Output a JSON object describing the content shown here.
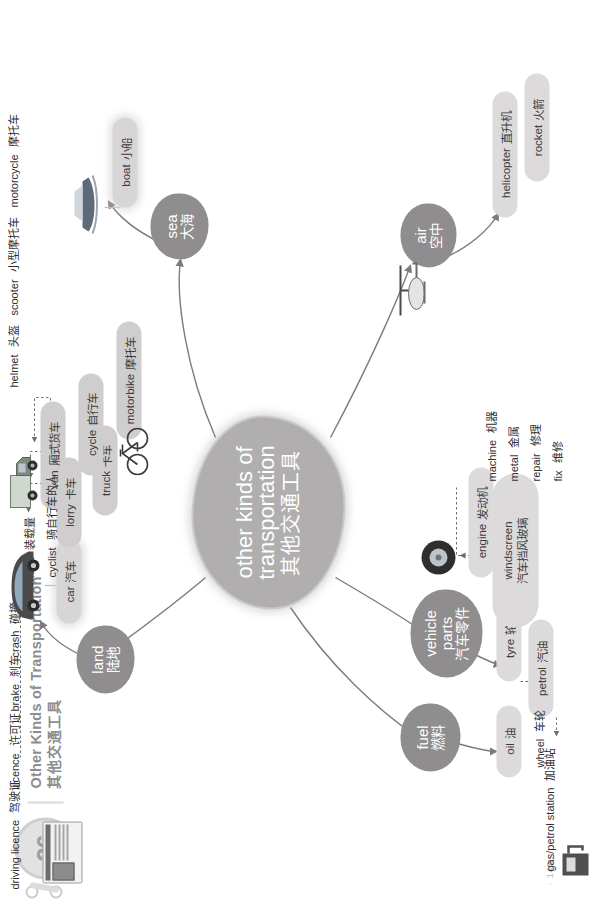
{
  "header": {
    "badge_number": "26",
    "title_en": "Other Kinds of Transportation",
    "title_cn": "其他交通工具"
  },
  "footer": {
    "page": "· 140 ·"
  },
  "hub": {
    "en_line1": "other kinds of",
    "en_line2": "transportation",
    "cn": "其他交通工具"
  },
  "branches": {
    "land": {
      "en": "land",
      "cn": "陆地"
    },
    "sea": {
      "en": "sea",
      "cn": "大海"
    },
    "air": {
      "en": "air",
      "cn": "空中"
    },
    "fuel": {
      "en": "fuel",
      "cn": "燃料"
    },
    "vehicle_parts": {
      "en_line1": "vehicle",
      "en_line2": "parts",
      "cn": "汽车零件"
    }
  },
  "land_items": [
    {
      "en": "car",
      "cn": "汽车"
    },
    {
      "en": "lorry",
      "cn": "卡车"
    },
    {
      "en": "truck",
      "cn": "卡车"
    },
    {
      "en": "van",
      "cn": "厢式货车"
    },
    {
      "en": "cycle",
      "cn": "自行车"
    },
    {
      "en": "motorbike",
      "cn": "摩托车"
    }
  ],
  "car_notes": [
    {
      "en": "driving licence",
      "cn": "驾驶证"
    },
    {
      "en": "licence",
      "cn": "许可证"
    },
    {
      "en": "brake",
      "cn": "刹车"
    },
    {
      "en": "crash",
      "cn": "碰撞"
    }
  ],
  "van_note": {
    "en": "load",
    "cn": "装载量"
  },
  "cycle_note": {
    "en": "cyclist",
    "cn": "骑自行车的人"
  },
  "motorbike_notes": [
    {
      "en": "helmet",
      "cn": "头盔"
    },
    {
      "en": "scooter",
      "cn": "小型摩托车"
    },
    {
      "en": "motorcycle",
      "cn": "摩托车"
    }
  ],
  "sea_items": [
    {
      "en": "boat",
      "cn": "小船"
    }
  ],
  "air_items": [
    {
      "en": "helicopter",
      "cn": "直升机"
    },
    {
      "en": "rocket",
      "cn": "火箭"
    }
  ],
  "fuel_items": [
    {
      "en": "oil",
      "cn": "油"
    },
    {
      "en": "petrol",
      "cn": "汽油"
    }
  ],
  "fuel_notes": [
    {
      "en": "gas/petrol station",
      "cn": "加油站"
    }
  ],
  "parts_items": [
    {
      "en": "tyre",
      "cn": "轮胎"
    },
    {
      "en": "windscreen",
      "cn": "汽车挡风玻璃"
    },
    {
      "en": "engine",
      "cn": "发动机"
    }
  ],
  "tyre_note": {
    "en": "wheel",
    "cn": "车轮"
  },
  "engine_notes": [
    {
      "en": "machine",
      "cn": "机器"
    },
    {
      "en": "metal",
      "cn": "金属"
    },
    {
      "en": "repair",
      "cn": "修理"
    },
    {
      "en": "fix",
      "cn": "维修"
    }
  ],
  "pictures": [
    {
      "name": "driving-licence-card",
      "caption": "CALIFORNIA"
    },
    {
      "name": "car-photo"
    },
    {
      "name": "van-photo"
    },
    {
      "name": "bicycle-photo"
    },
    {
      "name": "boat-photo"
    },
    {
      "name": "helicopter-photo"
    },
    {
      "name": "tyre-photo"
    },
    {
      "name": "fuel-pump-photo"
    }
  ],
  "colors": {
    "hub": "#b0aeae",
    "node": "#8f8d8d",
    "pill": "#cfcdcd",
    "text": "#2f2f2f",
    "header": "#8d8d8d"
  }
}
